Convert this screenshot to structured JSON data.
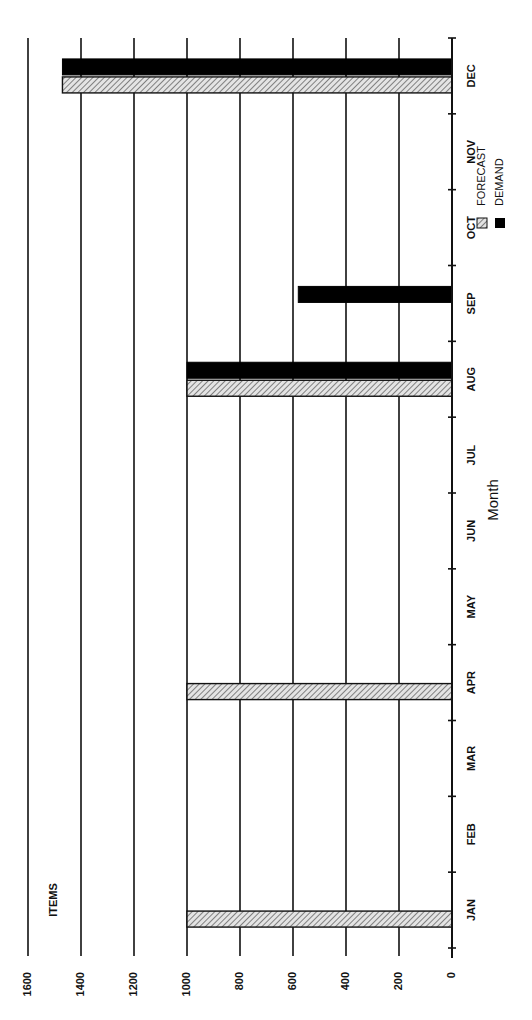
{
  "chart_data": {
    "type": "bar",
    "orientation": "horizontal (rotated page; months along right axis)",
    "title": "",
    "xlabel": "Month",
    "ylabel": "ITEMS",
    "categories": [
      "JAN",
      "FEB",
      "MAR",
      "APR",
      "MAY",
      "JUN",
      "JUL",
      "AUG",
      "SEP",
      "OCT",
      "NOV",
      "DEC"
    ],
    "series": [
      {
        "name": "FORECAST",
        "pattern": "hatched",
        "values": [
          1000,
          null,
          null,
          1000,
          null,
          null,
          null,
          1000,
          null,
          null,
          null,
          1470
        ]
      },
      {
        "name": "DEMAND",
        "pattern": "solid",
        "values": [
          null,
          null,
          null,
          null,
          null,
          null,
          null,
          1000,
          580,
          null,
          null,
          1470
        ]
      }
    ],
    "value_ticks": [
      0,
      200,
      400,
      600,
      800,
      1000,
      1200,
      1400,
      1600
    ],
    "ylim": [
      0,
      1600
    ],
    "grid": true,
    "legend_position": "upper-right area inside plot",
    "colors": {
      "forecast": "#bdbdbd",
      "demand": "#000000",
      "grid": "#111111"
    }
  },
  "labels": {
    "items": "ITEMS",
    "month": "Month",
    "legend_forecast": "FORECAST",
    "legend_demand": "DEMAND"
  }
}
